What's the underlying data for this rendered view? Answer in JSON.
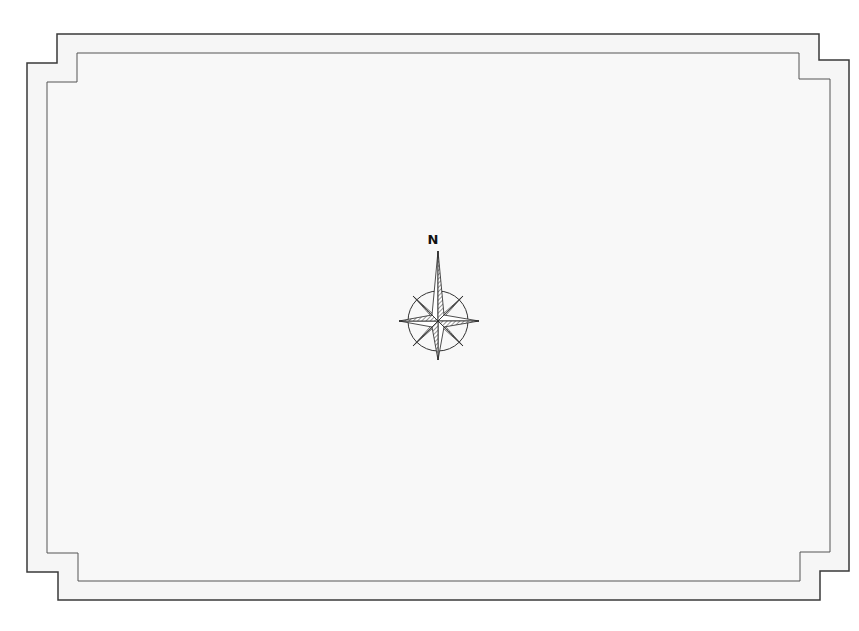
{
  "map": {
    "title": "",
    "background_color": "#f6f6f6",
    "frame_color": "#3a3a3a",
    "compass": {
      "north_label": "N",
      "icon": "compass-rose-icon"
    }
  }
}
